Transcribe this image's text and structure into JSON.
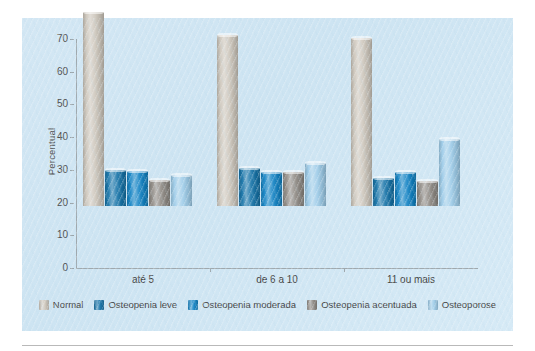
{
  "chart_data": {
    "type": "bar",
    "title": "",
    "xlabel": "",
    "ylabel": "Percentual",
    "ylim": [
      0,
      70
    ],
    "ytick_step": 10,
    "yticks": [
      70,
      60,
      50,
      40,
      30,
      20,
      10,
      0
    ],
    "grid": false,
    "legend_position": "bottom",
    "categories": [
      "até 5",
      "de 6 a 10",
      "11 ou mais"
    ],
    "series": [
      {
        "name": "Normal",
        "color": "#cdc6bb",
        "values": [
          59.4,
          52.2,
          51.3
        ]
      },
      {
        "name": "Osteopenia leve",
        "color": "#1573a8",
        "values": [
          11.0,
          11.5,
          8.7
        ]
      },
      {
        "name": "Osteopenia moderada",
        "color": "#1082c4",
        "values": [
          10.8,
          10.5,
          10.5
        ]
      },
      {
        "name": "Osteopenia acentuada",
        "color": "#8f8a84",
        "values": [
          8.1,
          10.3,
          7.7
        ]
      },
      {
        "name": "Osteoporose",
        "color": "#9ccbe8",
        "values": [
          9.5,
          13.3,
          20.4
        ]
      }
    ]
  },
  "figure": {
    "background_color": "#d2e6f3",
    "axis_color": "#9fa8ad",
    "text_color": "#3f3f3f"
  }
}
